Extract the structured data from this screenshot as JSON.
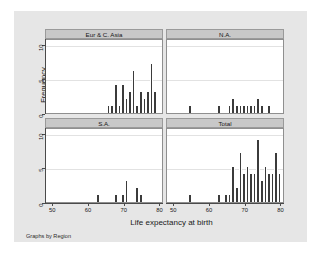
{
  "figure": {
    "background_color": "#e6e6e6",
    "panel_header_color": "#c8c8c8",
    "bar_color": "#3b3b3b",
    "plot_background": "#ffffff",
    "footer_note": "Graphs by Region",
    "y_axis_title": "Frequency",
    "x_axis_title": "Life expectancy at birth"
  },
  "chart_data": {
    "type": "bar",
    "title": "",
    "subtitle": "",
    "xlabel": "Life expectancy at birth",
    "ylabel": "Frequency",
    "xlim": [
      48,
      81
    ],
    "ylim": [
      0,
      10.8
    ],
    "xticks": [
      50,
      60,
      70,
      80
    ],
    "yticks": [
      0,
      5,
      10
    ],
    "grid": true,
    "legend": null,
    "annotations": [
      "Graphs by Region"
    ],
    "facet_layout": "2x2",
    "bin_width": 1,
    "panels": [
      {
        "label": "Eur & C. Asia",
        "row": 0,
        "col": 0,
        "bins": [
          {
            "x": 65,
            "count": 1
          },
          {
            "x": 66,
            "count": 1
          },
          {
            "x": 67,
            "count": 4
          },
          {
            "x": 68,
            "count": 1
          },
          {
            "x": 69,
            "count": 4
          },
          {
            "x": 70,
            "count": 2
          },
          {
            "x": 71,
            "count": 3
          },
          {
            "x": 72,
            "count": 6
          },
          {
            "x": 73,
            "count": 1
          },
          {
            "x": 74,
            "count": 3
          },
          {
            "x": 75,
            "count": 2
          },
          {
            "x": 76,
            "count": 3
          },
          {
            "x": 77,
            "count": 7
          },
          {
            "x": 78,
            "count": 3
          }
        ]
      },
      {
        "label": "N.A.",
        "row": 0,
        "col": 1,
        "bins": [
          {
            "x": 54,
            "count": 1
          },
          {
            "x": 62,
            "count": 1
          },
          {
            "x": 65,
            "count": 1
          },
          {
            "x": 66,
            "count": 2
          },
          {
            "x": 67,
            "count": 1
          },
          {
            "x": 68,
            "count": 1
          },
          {
            "x": 69,
            "count": 1
          },
          {
            "x": 70,
            "count": 1
          },
          {
            "x": 71,
            "count": 1
          },
          {
            "x": 72,
            "count": 1
          },
          {
            "x": 73,
            "count": 2
          },
          {
            "x": 74,
            "count": 1
          },
          {
            "x": 76,
            "count": 1
          }
        ]
      },
      {
        "label": "S.A.",
        "row": 1,
        "col": 0,
        "bins": [
          {
            "x": 62,
            "count": 1
          },
          {
            "x": 67,
            "count": 1
          },
          {
            "x": 69,
            "count": 1
          },
          {
            "x": 70,
            "count": 3
          },
          {
            "x": 73,
            "count": 2
          },
          {
            "x": 74,
            "count": 1
          }
        ]
      },
      {
        "label": "Total",
        "row": 1,
        "col": 1,
        "bins": [
          {
            "x": 54,
            "count": 1
          },
          {
            "x": 62,
            "count": 1
          },
          {
            "x": 64,
            "count": 1
          },
          {
            "x": 65,
            "count": 1
          },
          {
            "x": 66,
            "count": 5
          },
          {
            "x": 67,
            "count": 2
          },
          {
            "x": 68,
            "count": 7
          },
          {
            "x": 69,
            "count": 4
          },
          {
            "x": 70,
            "count": 5
          },
          {
            "x": 71,
            "count": 4
          },
          {
            "x": 72,
            "count": 4
          },
          {
            "x": 73,
            "count": 9
          },
          {
            "x": 74,
            "count": 3
          },
          {
            "x": 75,
            "count": 5
          },
          {
            "x": 76,
            "count": 4
          },
          {
            "x": 77,
            "count": 4
          },
          {
            "x": 78,
            "count": 7
          },
          {
            "x": 79,
            "count": 4
          }
        ]
      }
    ]
  }
}
